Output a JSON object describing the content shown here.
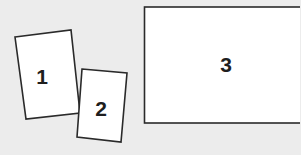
{
  "panels": [
    {
      "label": "1"
    },
    {
      "label": "2"
    },
    {
      "label": "3"
    }
  ],
  "colors": {
    "background": "#ececec",
    "panel_fill": "#ffffff",
    "outline": "#2a2a2a"
  }
}
